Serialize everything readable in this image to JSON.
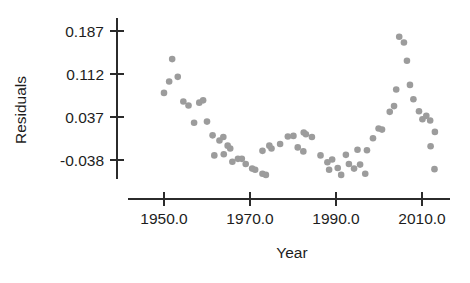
{
  "chart_data": {
    "type": "scatter",
    "title": "",
    "xlabel": "Year",
    "ylabel": "Residuals",
    "xlim": [
      1941.6,
      2016.5
    ],
    "ylim": [
      -0.072,
      0.205
    ],
    "grid": false,
    "legend": null,
    "marker": {
      "shape": "circle",
      "color": "#9c9c9c",
      "size_px": 3.3
    },
    "xticks": [
      1950.0,
      1970.0,
      1990.0,
      2010.0
    ],
    "xticklabels": [
      "1950.0",
      "1970.0",
      "1990.0",
      "2010.0"
    ],
    "yticks": [
      0.187,
      0.112,
      0.037,
      -0.038
    ],
    "yticklabels": [
      "0.187",
      "0.112",
      "0.037",
      "-0.038"
    ],
    "points": [
      {
        "x": 1951.9,
        "y": 0.138
      },
      {
        "x": 1953.2,
        "y": 0.107
      },
      {
        "x": 1951.2,
        "y": 0.099
      },
      {
        "x": 1950.0,
        "y": 0.079
      },
      {
        "x": 1954.5,
        "y": 0.064
      },
      {
        "x": 1955.7,
        "y": 0.057
      },
      {
        "x": 1958.2,
        "y": 0.062
      },
      {
        "x": 1959.1,
        "y": 0.066
      },
      {
        "x": 1957.0,
        "y": 0.027
      },
      {
        "x": 1960.0,
        "y": 0.029
      },
      {
        "x": 1961.3,
        "y": 0.005
      },
      {
        "x": 1962.9,
        "y": -0.004
      },
      {
        "x": 1963.8,
        "y": 0.002
      },
      {
        "x": 1964.8,
        "y": -0.013
      },
      {
        "x": 1965.4,
        "y": -0.018
      },
      {
        "x": 1961.7,
        "y": -0.03
      },
      {
        "x": 1963.9,
        "y": -0.028
      },
      {
        "x": 1965.9,
        "y": -0.041
      },
      {
        "x": 1967.2,
        "y": -0.036
      },
      {
        "x": 1968.1,
        "y": -0.036
      },
      {
        "x": 1969.0,
        "y": -0.045
      },
      {
        "x": 1970.5,
        "y": -0.053
      },
      {
        "x": 1971.2,
        "y": -0.055
      },
      {
        "x": 1972.9,
        "y": -0.062
      },
      {
        "x": 1973.7,
        "y": -0.064
      },
      {
        "x": 1972.9,
        "y": -0.022
      },
      {
        "x": 1975.0,
        "y": -0.018
      },
      {
        "x": 1974.5,
        "y": -0.013
      },
      {
        "x": 1977.0,
        "y": -0.01
      },
      {
        "x": 1978.8,
        "y": 0.003
      },
      {
        "x": 1980.1,
        "y": 0.004
      },
      {
        "x": 1982.5,
        "y": 0.01
      },
      {
        "x": 1983.0,
        "y": 0.007
      },
      {
        "x": 1984.4,
        "y": 0.002
      },
      {
        "x": 1981.1,
        "y": -0.016
      },
      {
        "x": 1982.4,
        "y": -0.023
      },
      {
        "x": 1986.4,
        "y": -0.03
      },
      {
        "x": 1988.0,
        "y": -0.042
      },
      {
        "x": 1989.1,
        "y": -0.037
      },
      {
        "x": 1988.4,
        "y": -0.055
      },
      {
        "x": 1990.4,
        "y": -0.052
      },
      {
        "x": 1991.2,
        "y": -0.064
      },
      {
        "x": 1993.0,
        "y": -0.045
      },
      {
        "x": 1994.2,
        "y": -0.053
      },
      {
        "x": 1995.6,
        "y": -0.046
      },
      {
        "x": 1996.8,
        "y": -0.062
      },
      {
        "x": 1992.3,
        "y": -0.029
      },
      {
        "x": 1995.0,
        "y": -0.02
      },
      {
        "x": 1997.2,
        "y": -0.021
      },
      {
        "x": 1998.6,
        "y": 0.0
      },
      {
        "x": 1999.9,
        "y": 0.017
      },
      {
        "x": 2000.7,
        "y": 0.015
      },
      {
        "x": 2002.5,
        "y": 0.046
      },
      {
        "x": 2003.5,
        "y": 0.056
      },
      {
        "x": 2004.0,
        "y": 0.085
      },
      {
        "x": 2004.7,
        "y": 0.177
      },
      {
        "x": 2005.8,
        "y": 0.167
      },
      {
        "x": 2006.5,
        "y": 0.135
      },
      {
        "x": 2007.2,
        "y": 0.093
      },
      {
        "x": 2008.0,
        "y": 0.068
      },
      {
        "x": 2009.3,
        "y": 0.047
      },
      {
        "x": 2010.1,
        "y": 0.033
      },
      {
        "x": 2011.0,
        "y": 0.039
      },
      {
        "x": 2011.9,
        "y": 0.031
      },
      {
        "x": 2013.0,
        "y": 0.011
      },
      {
        "x": 2012.0,
        "y": -0.014
      },
      {
        "x": 2012.9,
        "y": -0.054
      }
    ]
  },
  "axes": {
    "y_axis_name": "residuals-axis",
    "x_axis_name": "year-axis"
  }
}
